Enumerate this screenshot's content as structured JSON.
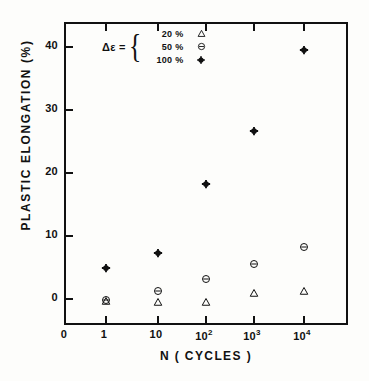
{
  "figure": {
    "background_color": "#fdfdfb",
    "ink_color": "#111111"
  },
  "legend": {
    "equals_label": "Δε =",
    "rows": [
      {
        "value": "20",
        "unit": "%",
        "symbol_name": "open-triangle-marker",
        "symbol": "triangle"
      },
      {
        "value": "50",
        "unit": "%",
        "symbol_name": "circle-dash-marker",
        "symbol": "circle-dash"
      },
      {
        "value": "100",
        "unit": "%",
        "symbol_name": "circle-cross-marker",
        "symbol": "circle-cross"
      }
    ]
  },
  "axes": {
    "y_title": "PLASTIC  ELONGATION  (%)",
    "x_title": "N   ( CYCLES )",
    "y_ticks": [
      "0",
      "10",
      "20",
      "30",
      "40"
    ],
    "x_ticks": [
      {
        "label": "0",
        "sup": ""
      },
      {
        "label": "1",
        "sup": ""
      },
      {
        "label": "10",
        "sup": ""
      },
      {
        "label": "10",
        "sup": "2"
      },
      {
        "label": "10",
        "sup": "3"
      },
      {
        "label": "10",
        "sup": "4"
      }
    ]
  },
  "chart_data": {
    "type": "scatter",
    "title": "",
    "xlabel": "N ( CYCLES )",
    "ylabel": "PLASTIC ELONGATION (%)",
    "xscale": "log",
    "yscale": "linear",
    "xlim": [
      0.35,
      40000
    ],
    "ylim": [
      -3.5,
      44.5
    ],
    "grid": false,
    "legend_position": "top-left-inside",
    "x": [
      1,
      10,
      100,
      1000,
      10000
    ],
    "xtick_labels": [
      "1",
      "10",
      "10^2",
      "10^3",
      "10^4"
    ],
    "ytick_values": [
      0,
      10,
      20,
      30,
      40
    ],
    "series": [
      {
        "name": "20 %",
        "marker": "triangle",
        "values": [
          -0.3,
          -0.4,
          -0.4,
          0.9,
          1.2
        ]
      },
      {
        "name": "50 %",
        "marker": "circle-dash",
        "values": [
          -0.1,
          1.2,
          3.1,
          5.6,
          8.2
        ]
      },
      {
        "name": "100 %",
        "marker": "circle-cross",
        "values": [
          4.9,
          7.3,
          18.3,
          26.6,
          39.5
        ]
      }
    ]
  }
}
